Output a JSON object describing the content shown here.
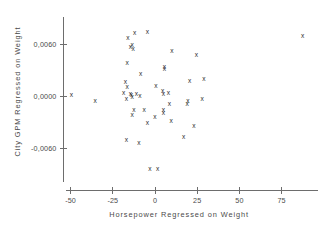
{
  "chart_data": {
    "type": "scatter",
    "title": "",
    "xlabel": "Horsepower  Regressed  on  Weight",
    "ylabel": "City  GPM  Regressed  on  Weight",
    "xlim": [
      -58,
      98
    ],
    "ylim": [
      -0.0105,
      0.0092
    ],
    "xticks": [
      -50,
      -25,
      0,
      25,
      50,
      75
    ],
    "xticklabels": [
      "-50",
      "-25",
      "0",
      "25",
      "50",
      "75"
    ],
    "yticks": [
      0.006,
      0.0,
      -0.006
    ],
    "yticklabels": [
      "0,0060",
      "0,0000",
      "-0,0060"
    ],
    "grid": false,
    "legend": false,
    "marker": "x",
    "marker_color": "#2e2e2e",
    "points": [
      {
        "x": -49.5,
        "y": 5e-05
      },
      {
        "x": -35.5,
        "y": -0.00055
      },
      {
        "x": -16.0,
        "y": 0.00665
      },
      {
        "x": -12.0,
        "y": 0.0072
      },
      {
        "x": -14.5,
        "y": 0.00565
      },
      {
        "x": -13.0,
        "y": 0.00545
      },
      {
        "x": -13.5,
        "y": 0.0059
      },
      {
        "x": -16.5,
        "y": 0.0038
      },
      {
        "x": -17.5,
        "y": 0.00155
      },
      {
        "x": -16.5,
        "y": 0.00105
      },
      {
        "x": -18.5,
        "y": 0.00035
      },
      {
        "x": -17.0,
        "y": -0.00035
      },
      {
        "x": -14.5,
        "y": 0.00015
      },
      {
        "x": -14.0,
        "y": 5e-05
      },
      {
        "x": -13.5,
        "y": -0.0001
      },
      {
        "x": -11.0,
        "y": 0.0002
      },
      {
        "x": -12.5,
        "y": -0.0017
      },
      {
        "x": -13.5,
        "y": -0.00225
      },
      {
        "x": -17.0,
        "y": -0.00505
      },
      {
        "x": -9.5,
        "y": -0.00545
      },
      {
        "x": -8.5,
        "y": 0.00255
      },
      {
        "x": -9.0,
        "y": 0.0
      },
      {
        "x": -6.5,
        "y": -0.0016
      },
      {
        "x": -4.5,
        "y": -0.0032
      },
      {
        "x": -4.5,
        "y": 0.0074
      },
      {
        "x": -3.0,
        "y": -0.0085
      },
      {
        "x": 1.5,
        "y": -0.0085
      },
      {
        "x": 0.5,
        "y": 0.00115
      },
      {
        "x": 0.0,
        "y": -0.0025
      },
      {
        "x": 4.5,
        "y": 0.0006
      },
      {
        "x": 5.0,
        "y": 0.00025
      },
      {
        "x": 5.5,
        "y": 0.00335
      },
      {
        "x": 5.5,
        "y": 0.00305
      },
      {
        "x": 5.0,
        "y": -0.00165
      },
      {
        "x": 5.0,
        "y": -0.00195
      },
      {
        "x": 8.0,
        "y": 0.0003
      },
      {
        "x": 8.5,
        "y": -0.00095
      },
      {
        "x": 9.5,
        "y": -0.0029
      },
      {
        "x": 10.0,
        "y": 0.0052
      },
      {
        "x": 17.0,
        "y": -0.0048
      },
      {
        "x": 19.5,
        "y": -0.00055
      },
      {
        "x": 19.0,
        "y": -0.00095
      },
      {
        "x": 20.5,
        "y": 0.00165
      },
      {
        "x": 23.0,
        "y": -0.00345
      },
      {
        "x": 24.5,
        "y": 0.0047
      },
      {
        "x": 28.0,
        "y": -0.0004
      },
      {
        "x": 29.0,
        "y": 0.0019
      },
      {
        "x": 87.5,
        "y": 0.00695
      }
    ]
  }
}
